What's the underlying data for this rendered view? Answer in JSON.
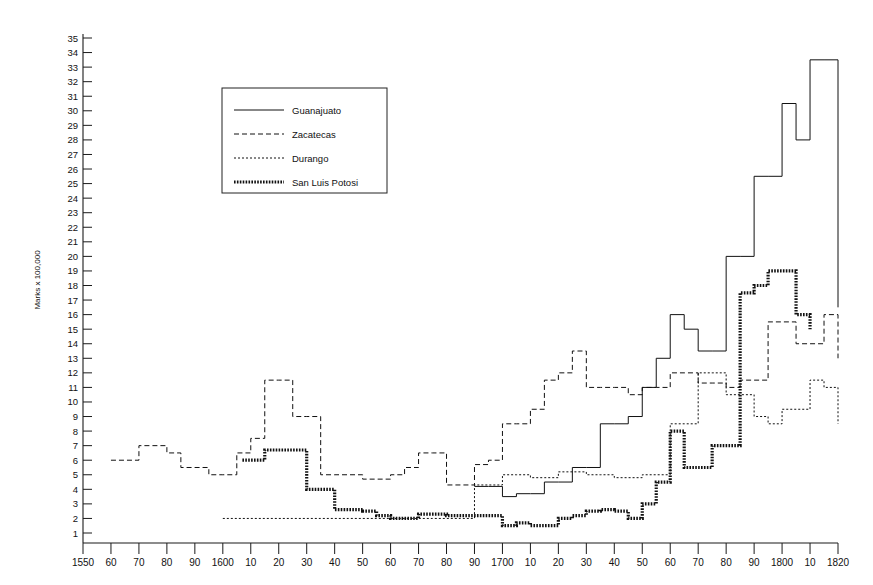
{
  "chart_data": {
    "type": "line",
    "title": "",
    "subtitle": "",
    "xlabel": "",
    "ylabel": "Marks x 100,000",
    "xlim": [
      1550,
      1820
    ],
    "ylim": [
      0,
      35
    ],
    "grid": false,
    "legend_position": "upper-left-inside",
    "x_tick_labels": [
      "1550",
      "60",
      "70",
      "80",
      "90",
      "1600",
      "10",
      "20",
      "30",
      "40",
      "50",
      "60",
      "70",
      "80",
      "90",
      "1700",
      "10",
      "20",
      "30",
      "40",
      "50",
      "60",
      "70",
      "80",
      "90",
      "1800",
      "10",
      "1820"
    ],
    "x_tick_values": [
      1550,
      1560,
      1570,
      1580,
      1590,
      1600,
      1610,
      1620,
      1630,
      1640,
      1650,
      1660,
      1670,
      1680,
      1690,
      1700,
      1710,
      1720,
      1730,
      1740,
      1750,
      1760,
      1770,
      1780,
      1790,
      1800,
      1810,
      1820
    ],
    "y_tick_labels": [
      "1",
      "2",
      "3",
      "4",
      "5",
      "6",
      "7",
      "8",
      "9",
      "10",
      "11",
      "12",
      "13",
      "14",
      "15",
      "16",
      "17",
      "18",
      "19",
      "20",
      "21",
      "22",
      "23",
      "24",
      "25",
      "26",
      "27",
      "28",
      "29",
      "30",
      "31",
      "32",
      "33",
      "34",
      "35"
    ],
    "y_tick_values": [
      1,
      2,
      3,
      4,
      5,
      6,
      7,
      8,
      9,
      10,
      11,
      12,
      13,
      14,
      15,
      16,
      17,
      18,
      19,
      20,
      21,
      22,
      23,
      24,
      25,
      26,
      27,
      28,
      29,
      30,
      31,
      32,
      33,
      34,
      35
    ],
    "series": [
      {
        "name": "Guanajuato",
        "style": "solid",
        "x": [
          1690,
          1695,
          1700,
          1705,
          1710,
          1715,
          1720,
          1725,
          1730,
          1735,
          1740,
          1745,
          1750,
          1755,
          1760,
          1765,
          1770,
          1775,
          1780,
          1785,
          1790,
          1795,
          1800,
          1805,
          1810,
          1815,
          1820
        ],
        "values": [
          4.2,
          4.2,
          3.5,
          3.7,
          3.7,
          4.5,
          4.5,
          5.5,
          5.5,
          8.5,
          8.5,
          9.0,
          11.0,
          13.0,
          16.0,
          15.0,
          13.5,
          13.5,
          20.0,
          20.0,
          25.5,
          25.5,
          30.5,
          28.0,
          33.5,
          33.5,
          16.5
        ]
      },
      {
        "name": "Zacatecas",
        "style": "dashed",
        "x": [
          1560,
          1565,
          1570,
          1575,
          1580,
          1585,
          1590,
          1595,
          1600,
          1605,
          1610,
          1615,
          1620,
          1625,
          1630,
          1635,
          1640,
          1645,
          1650,
          1655,
          1660,
          1665,
          1670,
          1675,
          1680,
          1685,
          1690,
          1695,
          1700,
          1705,
          1710,
          1715,
          1720,
          1725,
          1730,
          1735,
          1740,
          1745,
          1750,
          1755,
          1760,
          1765,
          1770,
          1775,
          1780,
          1785,
          1790,
          1795,
          1800,
          1805,
          1810,
          1815,
          1820
        ],
        "values": [
          6.0,
          6.0,
          7.0,
          7.0,
          6.5,
          5.5,
          5.5,
          5.0,
          5.0,
          6.5,
          7.5,
          11.5,
          11.5,
          9.0,
          9.0,
          5.0,
          5.0,
          5.0,
          4.7,
          4.7,
          5.0,
          5.5,
          6.5,
          6.5,
          4.3,
          4.3,
          5.7,
          6.0,
          8.5,
          8.5,
          9.5,
          11.5,
          12.0,
          13.5,
          11.0,
          11.0,
          11.0,
          10.5,
          11.0,
          11.0,
          12.0,
          12.0,
          11.3,
          11.3,
          11.0,
          11.5,
          11.5,
          15.5,
          15.5,
          14.0,
          14.0,
          16.0,
          13.0
        ]
      },
      {
        "name": "Durango",
        "style": "dotted",
        "x": [
          1600,
          1605,
          1610,
          1615,
          1620,
          1625,
          1630,
          1635,
          1640,
          1645,
          1650,
          1655,
          1660,
          1665,
          1670,
          1675,
          1680,
          1685,
          1690,
          1695,
          1700,
          1705,
          1710,
          1715,
          1720,
          1725,
          1730,
          1735,
          1740,
          1745,
          1750,
          1755,
          1760,
          1765,
          1770,
          1775,
          1780,
          1785,
          1790,
          1795,
          1800,
          1805,
          1810,
          1815,
          1820
        ],
        "values": [
          2.0,
          2.0,
          2.0,
          2.0,
          2.0,
          2.0,
          2.0,
          2.0,
          2.0,
          2.0,
          2.0,
          2.0,
          2.0,
          2.0,
          2.0,
          2.0,
          2.0,
          2.0,
          4.3,
          4.3,
          5.0,
          5.0,
          4.8,
          4.8,
          5.2,
          5.2,
          5.0,
          5.0,
          4.8,
          4.8,
          5.0,
          5.0,
          8.5,
          8.5,
          12.0,
          12.0,
          10.5,
          10.5,
          9.0,
          8.5,
          9.5,
          9.5,
          11.5,
          11.0,
          8.5
        ]
      },
      {
        "name": "San Luis Potosi",
        "style": "thick-dotted",
        "x": [
          1607,
          1610,
          1615,
          1620,
          1630,
          1635,
          1640,
          1645,
          1650,
          1655,
          1660,
          1665,
          1670,
          1675,
          1680,
          1685,
          1690,
          1700,
          1705,
          1710,
          1715,
          1720,
          1725,
          1730,
          1735,
          1740,
          1745,
          1750,
          1755,
          1760,
          1765,
          1770,
          1775,
          1780,
          1785,
          1790,
          1795,
          1800,
          1805,
          1810
        ],
        "values": [
          6.0,
          6.0,
          6.7,
          6.7,
          4.0,
          4.0,
          2.6,
          2.6,
          2.5,
          2.2,
          2.0,
          2.0,
          2.3,
          2.3,
          2.2,
          2.2,
          2.2,
          1.5,
          1.7,
          1.5,
          1.5,
          2.0,
          2.2,
          2.5,
          2.6,
          2.5,
          2.0,
          3.0,
          4.5,
          8.0,
          5.5,
          5.5,
          7.0,
          7.0,
          17.5,
          18.0,
          19.0,
          19.0,
          16.0,
          15.0
        ]
      }
    ],
    "legend_entries": [
      {
        "label": "Guanajuato",
        "style": "solid"
      },
      {
        "label": "Zacatecas",
        "style": "dashed"
      },
      {
        "label": "Durango",
        "style": "dotted"
      },
      {
        "label": "San Luis Potosi",
        "style": "thick-dotted"
      }
    ]
  },
  "colors": {
    "ink": "#111111",
    "background": "#ffffff"
  }
}
